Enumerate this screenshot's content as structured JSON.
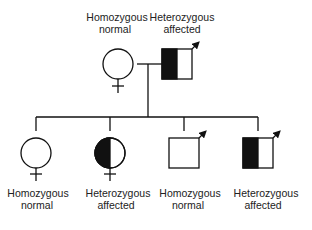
{
  "diagram": {
    "type": "pedigree",
    "colors": {
      "line": "#111111",
      "fill_affected": "#111111",
      "fill_normal": "#ffffff",
      "text": "#222222"
    },
    "parents": {
      "mother": {
        "sex": "female",
        "status": "homozygous normal",
        "label_line1": "Homozygous",
        "label_line2": "normal",
        "fill": "none"
      },
      "father": {
        "sex": "male",
        "status": "heterozygous affected",
        "label_line1": "Heterozygous",
        "label_line2": "affected",
        "fill": "left-half",
        "arrow": true
      }
    },
    "children": [
      {
        "sex": "female",
        "status": "homozygous normal",
        "label_line1": "Homozygous",
        "label_line2": "normal",
        "fill": "none",
        "arrow": false
      },
      {
        "sex": "female",
        "status": "heterozygous affected",
        "label_line1": "Heterozygous",
        "label_line2": "affected",
        "fill": "left-half",
        "arrow": false
      },
      {
        "sex": "male",
        "status": "homozygous normal",
        "label_line1": "Homozygous",
        "label_line2": "normal",
        "fill": "none",
        "arrow": true
      },
      {
        "sex": "male",
        "status": "heterozygous affected",
        "label_line1": "Heterozygous",
        "label_line2": "affected",
        "fill": "left-half",
        "arrow": true
      }
    ]
  }
}
